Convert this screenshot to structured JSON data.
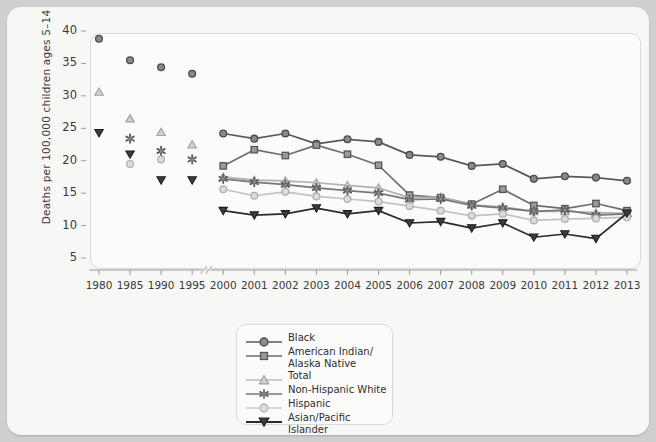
{
  "chart_data": {
    "type": "line",
    "title": "",
    "xlabel": "",
    "ylabel": "Deaths per 100,000 children ages 5–14",
    "ylim": [
      3,
      41
    ],
    "yticks": [
      5,
      10,
      15,
      20,
      25,
      30,
      35,
      40
    ],
    "grid": false,
    "legend_position": "bottom-center",
    "axis_break": true,
    "categories": [
      "1980",
      "1985",
      "1990",
      "1995",
      "2000",
      "2001",
      "2002",
      "2003",
      "2004",
      "2005",
      "2006",
      "2007",
      "2008",
      "2009",
      "2010",
      "2011",
      "2012",
      "2013"
    ],
    "series": [
      {
        "name": "Black",
        "marker": "circle",
        "color": "#595959",
        "values": [
          38.8,
          35.5,
          34.4,
          33.4,
          24.2,
          23.4,
          24.2,
          22.6,
          23.3,
          22.9,
          20.9,
          20.6,
          19.2,
          19.5,
          17.2,
          17.6,
          17.4,
          16.9
        ]
      },
      {
        "name": "American Indian/\nAlaska Native",
        "marker": "square",
        "color": "#6e6e6e",
        "values": [
          null,
          null,
          null,
          null,
          19.2,
          21.7,
          20.8,
          22.4,
          21.0,
          19.3,
          14.7,
          14.3,
          13.3,
          15.6,
          13.1,
          12.6,
          13.4,
          12.3
        ]
      },
      {
        "name": "Total",
        "marker": "triangle-up",
        "color": "#b0b0b0",
        "values": [
          30.6,
          26.5,
          24.4,
          22.5,
          17.5,
          17.0,
          16.9,
          16.6,
          16.2,
          15.8,
          14.3,
          14.4,
          13.2,
          12.9,
          12.2,
          12.2,
          12.0,
          11.9
        ]
      },
      {
        "name": "Non-Hispanic White",
        "marker": "star",
        "color": "#767676",
        "values": [
          null,
          23.4,
          21.5,
          20.2,
          17.2,
          16.7,
          16.3,
          15.8,
          15.4,
          15.0,
          14.0,
          14.1,
          13.1,
          12.7,
          12.2,
          12.4,
          11.6,
          11.8
        ]
      },
      {
        "name": "Hispanic",
        "marker": "circle-light",
        "color": "#c2c2c2",
        "values": [
          null,
          19.5,
          20.2,
          null,
          15.6,
          14.6,
          15.2,
          14.5,
          14.1,
          13.7,
          13.0,
          12.3,
          11.5,
          11.8,
          10.8,
          11.0,
          11.1,
          11.3
        ]
      },
      {
        "name": "Asian/Pacific Islander",
        "marker": "triangle-down",
        "color": "#2b2b2b",
        "values": [
          24.3,
          21.0,
          17.0,
          17.0,
          12.3,
          11.6,
          11.8,
          12.7,
          11.8,
          12.3,
          10.4,
          10.6,
          9.6,
          10.4,
          8.2,
          8.7,
          8.0,
          11.9
        ]
      }
    ]
  },
  "legend": {
    "items": [
      {
        "label": "Black"
      },
      {
        "label": "American Indian/"
      },
      {
        "label": "Alaska Native"
      },
      {
        "label": "Total"
      },
      {
        "label": "Non-Hispanic White"
      },
      {
        "label": "Hispanic"
      },
      {
        "label": "Asian/Pacific Islander"
      }
    ]
  }
}
